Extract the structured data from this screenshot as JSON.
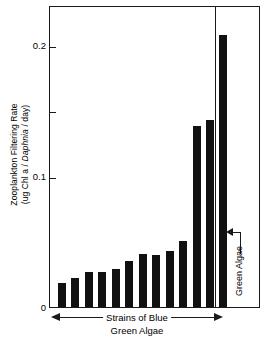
{
  "chart_data": {
    "type": "bar",
    "title": "",
    "xlabel": "Strains of Blue Green Algae",
    "ylabel": "Zooplankton Filtering Rate (ug Chl a / Daphnia / day)",
    "ylabel_line1": "Zooplankton Filtering Rate",
    "ylabel_line2_prefix": "(ug Chl a / ",
    "ylabel_line2_italic": "Daphnia",
    "ylabel_line2_suffix": " / day)",
    "ylim": [
      0,
      0.215
    ],
    "ytick_labeled": [
      "0",
      "0.1",
      "0.2"
    ],
    "ytick_labeled_values": [
      0,
      0.1,
      0.2
    ],
    "ytick_minor_values": [
      0.05,
      0.15
    ],
    "grid": false,
    "legend": "none",
    "bar_color": "#111111",
    "axis_color": "#1a1a1a",
    "categories": [
      "Blue-green strain 1",
      "Blue-green strain 2",
      "Blue-green strain 3",
      "Blue-green strain 4",
      "Blue-green strain 5",
      "Blue-green strain 6",
      "Blue-green strain 7",
      "Blue-green strain 8",
      "Blue-green strain 9",
      "Blue-green strain 10",
      "Blue-green strain 11",
      "Blue-green strain 12",
      "Green Algae"
    ],
    "values": [
      0.0175,
      0.021,
      0.025,
      0.025,
      0.027,
      0.033,
      0.038,
      0.037,
      0.04,
      0.047,
      0.13,
      0.134,
      0.195
    ],
    "annotations": [
      {
        "text": "Green Algae",
        "target_category": "Green Algae",
        "orientation": "vertical"
      },
      {
        "text": "Strains of Blue Green Algae",
        "type": "range-arrow",
        "spans_categories": 12
      }
    ]
  },
  "axis": {
    "y_tick_0": "0",
    "y_tick_1": "0.1",
    "y_tick_2": "0.2"
  },
  "callout": {
    "green_algae_label": "Green Algae"
  },
  "xcaption": {
    "line1": "Strains of Blue",
    "line2": "Green Algae"
  }
}
